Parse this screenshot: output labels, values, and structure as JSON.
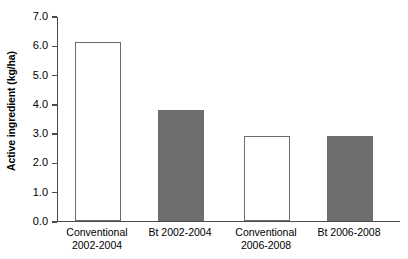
{
  "chart_data": {
    "type": "bar",
    "title": "",
    "subtitle": "",
    "xlabel": "",
    "ylabel": "Active ingredient (kg/ha)",
    "categories": [
      "Conventional 2002-2004",
      "Bt 2002-2004",
      "Conventional 2006-2008",
      "Bt 2006-2008"
    ],
    "category_lines": [
      [
        "Conventional",
        "2002-2004"
      ],
      [
        "Bt 2002-2004",
        ""
      ],
      [
        "Conventional",
        "2006-2008"
      ],
      [
        "Bt 2006-2008",
        ""
      ]
    ],
    "values": [
      6.1,
      3.8,
      2.9,
      2.9
    ],
    "bar_styles": [
      "open",
      "filled",
      "open",
      "filled"
    ],
    "ylim": [
      0.0,
      7.0
    ],
    "ytick_labels": [
      "7.0",
      "6.0",
      "5.0",
      "4.0",
      "3.0",
      "2.0",
      "1.0",
      "0.0"
    ],
    "ytick_values": [
      7.0,
      6.0,
      5.0,
      4.0,
      3.0,
      2.0,
      1.0,
      0.0
    ],
    "grid": false,
    "legend": "none",
    "colors": {
      "open_fill": "#ffffff",
      "open_edge": "#6b6b6b",
      "filled_fill": "#6e6e6e",
      "filled_edge": "#6e6e6e",
      "axis": "#4a4a4a",
      "text": "#000000",
      "background": "#ffffff"
    }
  }
}
